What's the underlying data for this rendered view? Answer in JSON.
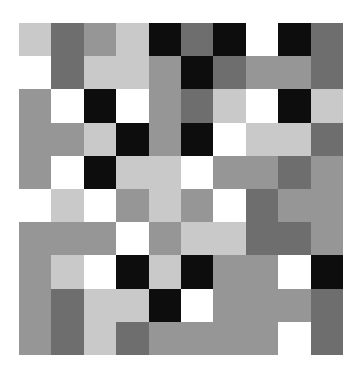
{
  "figure": {
    "title": "",
    "background": "#ffffff",
    "canvas_width": 361,
    "canvas_height": 377,
    "plot_left": 19,
    "plot_top": 23,
    "plot_width": 324,
    "plot_height": 332
  },
  "palette": {
    "white": "#ffffff",
    "light_gray": "#c9c9c9",
    "medium_gray": "#969696",
    "dark_gray": "#6e6e6e",
    "black": "#0d0d0d"
  },
  "chart_data": {
    "type": "heatmap",
    "title": "",
    "subtitle": "",
    "xlabel": "",
    "ylabel": "",
    "rows": 10,
    "cols": 10,
    "grid": false,
    "legend": "none",
    "axis_visible": false,
    "tick_labels_x": [],
    "tick_labels_y": [],
    "colormap": "gray",
    "value_levels": [
      0,
      1,
      2,
      3,
      4
    ],
    "level_colors": [
      "#0d0d0d",
      "#6e6e6e",
      "#969696",
      "#c9c9c9",
      "#ffffff"
    ],
    "level_names": [
      "black",
      "dark_gray",
      "medium_gray",
      "light_gray",
      "white"
    ],
    "values": [
      [
        3,
        1,
        2,
        3,
        0,
        1,
        0,
        4,
        0,
        1
      ],
      [
        4,
        1,
        3,
        3,
        2,
        0,
        1,
        2,
        2,
        1
      ],
      [
        2,
        4,
        0,
        4,
        2,
        1,
        3,
        4,
        0,
        3
      ],
      [
        2,
        2,
        3,
        0,
        2,
        0,
        4,
        3,
        3,
        1
      ],
      [
        2,
        4,
        0,
        3,
        3,
        4,
        2,
        2,
        1,
        2
      ],
      [
        4,
        3,
        4,
        2,
        3,
        2,
        4,
        1,
        2,
        2
      ],
      [
        2,
        2,
        2,
        4,
        2,
        3,
        3,
        1,
        1,
        2
      ],
      [
        2,
        3,
        4,
        0,
        3,
        0,
        2,
        2,
        4,
        0
      ],
      [
        2,
        1,
        3,
        3,
        0,
        4,
        2,
        2,
        2,
        1
      ],
      [
        2,
        1,
        3,
        1,
        2,
        2,
        2,
        2,
        4,
        1
      ]
    ],
    "colors": [
      [
        "#c9c9c9",
        "#6e6e6e",
        "#969696",
        "#c9c9c9",
        "#0d0d0d",
        "#6e6e6e",
        "#0d0d0d",
        "#ffffff",
        "#0d0d0d",
        "#6e6e6e"
      ],
      [
        "#ffffff",
        "#6e6e6e",
        "#c9c9c9",
        "#c9c9c9",
        "#969696",
        "#0d0d0d",
        "#6e6e6e",
        "#969696",
        "#969696",
        "#6e6e6e"
      ],
      [
        "#969696",
        "#ffffff",
        "#0d0d0d",
        "#ffffff",
        "#969696",
        "#6e6e6e",
        "#c9c9c9",
        "#ffffff",
        "#0d0d0d",
        "#c9c9c9"
      ],
      [
        "#969696",
        "#969696",
        "#c9c9c9",
        "#0d0d0d",
        "#969696",
        "#0d0d0d",
        "#ffffff",
        "#c9c9c9",
        "#c9c9c9",
        "#6e6e6e"
      ],
      [
        "#969696",
        "#ffffff",
        "#0d0d0d",
        "#c9c9c9",
        "#c9c9c9",
        "#ffffff",
        "#969696",
        "#969696",
        "#6e6e6e",
        "#969696"
      ],
      [
        "#ffffff",
        "#c9c9c9",
        "#ffffff",
        "#969696",
        "#c9c9c9",
        "#969696",
        "#ffffff",
        "#6e6e6e",
        "#969696",
        "#969696"
      ],
      [
        "#969696",
        "#969696",
        "#969696",
        "#ffffff",
        "#969696",
        "#c9c9c9",
        "#c9c9c9",
        "#6e6e6e",
        "#6e6e6e",
        "#969696"
      ],
      [
        "#969696",
        "#c9c9c9",
        "#ffffff",
        "#0d0d0d",
        "#c9c9c9",
        "#0d0d0d",
        "#969696",
        "#969696",
        "#ffffff",
        "#0d0d0d"
      ],
      [
        "#969696",
        "#6e6e6e",
        "#c9c9c9",
        "#c9c9c9",
        "#0d0d0d",
        "#ffffff",
        "#969696",
        "#969696",
        "#969696",
        "#6e6e6e"
      ],
      [
        "#969696",
        "#6e6e6e",
        "#c9c9c9",
        "#6e6e6e",
        "#969696",
        "#969696",
        "#969696",
        "#969696",
        "#ffffff",
        "#6e6e6e"
      ]
    ]
  }
}
